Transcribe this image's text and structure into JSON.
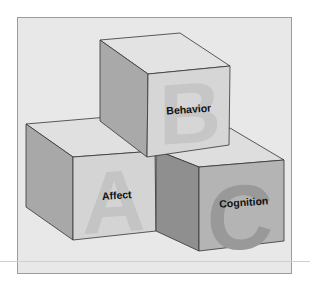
{
  "diagram": {
    "blocks": [
      {
        "id": "affect",
        "letter": "A",
        "label": "Affect"
      },
      {
        "id": "behavior",
        "letter": "B",
        "label": "Behavior"
      },
      {
        "id": "cognition",
        "letter": "C",
        "label": "Cognition"
      }
    ],
    "colors": {
      "panel_bg": "#e8e8e8",
      "panel_border": "#9c9c9c",
      "top_face": "#e2e2e2",
      "left_face": "#a9a9a9",
      "front_face_light": "#d2d2d2",
      "front_face_dark": "#b5b5b5",
      "letter_light": "#c3c3c3",
      "letter_dark": "#9a9a9a"
    }
  }
}
